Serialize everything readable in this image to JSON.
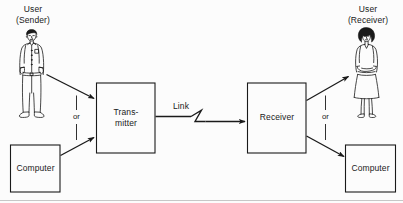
{
  "diagram": {
    "background_color": "#fcfcfc",
    "line_color": "#1a1a1a",
    "text_color": "#1a1a1a",
    "nodes": {
      "user_sender": {
        "label_line1": "User",
        "label_line2": "(Sender)",
        "icon": "standing-man-figure"
      },
      "user_receiver": {
        "label_line1": "User",
        "label_line2": "(Receiver)",
        "icon": "standing-woman-figure"
      },
      "computer_left": {
        "label": "Computer"
      },
      "computer_right": {
        "label": "Computer"
      },
      "transmitter": {
        "label_line1": "Trans-",
        "label_line2": "mitter"
      },
      "receiver": {
        "label": "Receiver"
      }
    },
    "connectors": {
      "or_left": "or",
      "or_right": "or",
      "link": "Link",
      "link_break_symbol": "zigzag-break"
    }
  }
}
